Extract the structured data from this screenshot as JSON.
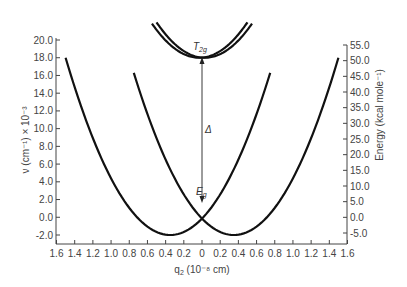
{
  "chart_data": {
    "type": "line",
    "title": "",
    "xlabel": "q₂ (10⁻⁸ cm)",
    "ylabel_left": "ν (cm⁻¹) × 10⁻³",
    "ylabel_right": "Energy (kcal mole⁻¹)",
    "x_ticks": [
      "1.6",
      "1.4",
      "1.2",
      "1.0",
      "0.8",
      "0.6",
      "0.4",
      "0.2",
      "0",
      "0.2",
      "0.4",
      "0.6",
      "0.8",
      "1.0",
      "1.2",
      "1.4",
      "1.6"
    ],
    "x_tick_values": [
      -1.6,
      -1.4,
      -1.2,
      -1.0,
      -0.8,
      -0.6,
      -0.4,
      -0.2,
      0,
      0.2,
      0.4,
      0.6,
      0.8,
      1.0,
      1.2,
      1.4,
      1.6
    ],
    "y_left_ticks": [
      "20.0",
      "18.0",
      "16.0",
      "14.0",
      "12.0",
      "10.0",
      "8.0",
      "6.0",
      "4.0",
      "2.0",
      "0.0",
      "-2.0"
    ],
    "y_left_range": [
      -2.0,
      20.0
    ],
    "y_right_ticks": [
      "55.0",
      "50.0",
      "45.0",
      "40.0",
      "35.0",
      "30.0",
      "25.0",
      "20.0",
      "15.0",
      "10.0",
      "5.0",
      "0.0",
      "-5.0"
    ],
    "y_right_range": [
      -5.0,
      55.0
    ],
    "xlim": [
      -1.6,
      1.6
    ],
    "grid": false,
    "legend": null,
    "series": [
      {
        "name": "Eg lower surface (left well)",
        "shape": "parabola",
        "vertex": [
          -0.35,
          -2.0
        ],
        "x_range": [
          -1.5,
          0.75
        ],
        "y_at_ends": 18.0
      },
      {
        "name": "Eg lower surface (right well)",
        "shape": "parabola",
        "vertex": [
          0.35,
          -2.0
        ],
        "x_range": [
          -0.75,
          1.5
        ],
        "y_at_ends": 18.0
      },
      {
        "name": "T2g upper surface (a)",
        "shape": "parabola",
        "vertex": [
          -0.03,
          18.0
        ],
        "x_range": [
          -0.55,
          0.5
        ],
        "y_at_ends": 22.0
      },
      {
        "name": "T2g upper surface (b)",
        "shape": "parabola",
        "vertex": [
          0.03,
          18.0
        ],
        "x_range": [
          -0.5,
          0.55
        ],
        "y_at_ends": 22.0
      }
    ],
    "annotations": [
      {
        "text": "T₂g",
        "x": 0,
        "y": 18.8
      },
      {
        "text": "Eɡ",
        "x": 0,
        "y": 2.6
      },
      {
        "text": "Δ",
        "x": 0.05,
        "y": 10.0,
        "note": "vertical double arrow from Eg crossing (~1.4) to T2g minimum (~18.0)"
      }
    ]
  },
  "labels": {
    "annot_t2g_main": "T",
    "annot_t2g_sub": "2g",
    "annot_eg_main": "E",
    "annot_eg_sub": "g",
    "annot_delta": "Δ",
    "ylabel_left": "ν (cm⁻¹) × 10⁻³",
    "ylabel_right": "Energy (kcal mole⁻¹)",
    "xlabel_main": "q",
    "xlabel_sub": "2",
    "xlabel_rest": " (10⁻⁸ cm)"
  },
  "colors": {
    "curve": "#111111",
    "axis": "#444444",
    "text": "#444444"
  }
}
